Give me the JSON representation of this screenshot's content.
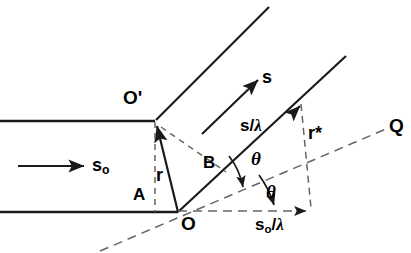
{
  "figure": {
    "kind": "scattering-geometry-diagram",
    "background": "#ffffff",
    "stroke": "#1a1a1a",
    "labels": {
      "o_prime": "O'",
      "o": "O",
      "point_a": "A",
      "point_b": "B",
      "r": "r",
      "r_star": "r*",
      "q": "Q",
      "s_vector": "s",
      "s_zero": "s",
      "s_zero_sub": "o",
      "s_over_lambda_num": "s",
      "s_over_lambda_slash": "/",
      "s_over_lambda_den": "λ",
      "s0_over_lambda_num": "s",
      "s0_over_lambda_sub": "o",
      "s0_over_lambda_slash": "/",
      "s0_over_lambda_den": "λ",
      "theta_upper": "θ",
      "theta_lower": "θ"
    },
    "geometry": {
      "o_prime_point": [
        155,
        121
      ],
      "o_point": [
        178,
        212
      ],
      "a_point": [
        155,
        212
      ],
      "b_point": [
        213,
        177
      ],
      "top_wavefront_line": [
        [
          0,
          121
        ],
        [
          155,
          121
        ]
      ],
      "bottom_wavefront_line": [
        [
          0,
          212
        ],
        [
          178,
          212
        ]
      ],
      "incident_arrow": [
        [
          18,
          166
        ],
        [
          88,
          166
        ]
      ],
      "scattered_ray_from_o_prime": [
        [
          155,
          121
        ],
        [
          268,
          8
        ]
      ],
      "scattered_ray_from_o": [
        [
          178,
          212
        ],
        [
          345,
          57
        ]
      ],
      "s_arrow": [
        [
          203,
          133
        ],
        [
          262,
          76
        ]
      ],
      "s_over_lambda_arrow_tip": [
        301,
        104
      ],
      "s0_over_lambda_arrow": [
        [
          178,
          212
        ],
        [
          311,
          212
        ]
      ],
      "r_vector": [
        [
          178,
          212
        ],
        [
          157,
          124
        ]
      ],
      "q_dashed_line": [
        [
          100,
          250
        ],
        [
          388,
          128
        ]
      ],
      "r_star_dashed": [
        [
          301,
          104
        ],
        [
          311,
          210
        ]
      ],
      "dashed_o_prime_to_b": [
        [
          160,
          126
        ],
        [
          224,
          170
        ]
      ],
      "dashed_vertical_a": [
        [
          155,
          121
        ],
        [
          155,
          212
        ]
      ],
      "theta_upper_arc_center": [
        178,
        212
      ],
      "theta_upper_arc_radius": 72,
      "theta_lower_arc_radius": 100
    }
  }
}
